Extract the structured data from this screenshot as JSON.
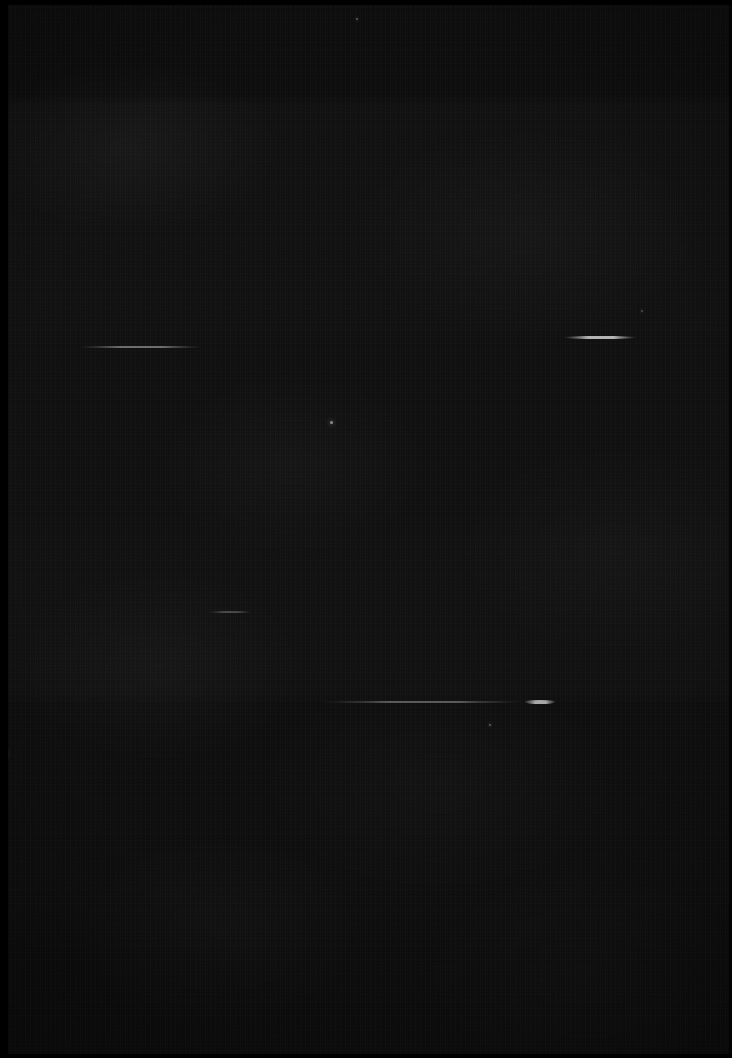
{
  "image": {
    "title": "Dark exposure frame",
    "width": 732,
    "height": 1058,
    "overall_description": "Near-black, heavily underexposed photographic frame dominated by sensor noise, with faint horizontal light streaks and a few small bright point sources.",
    "background_color": "#0d0d0d",
    "darkest_color": "#000000",
    "brightest_color": "#b4b4b4"
  },
  "borders": {
    "left_strip": {
      "label": "left black border",
      "x": 0,
      "y": 0,
      "width": 8,
      "height": 1058,
      "color": "#000000"
    },
    "top_strip": {
      "label": "top black border",
      "x": 0,
      "y": 0,
      "width": 732,
      "height": 5,
      "color": "#000000"
    },
    "bottom_strip": {
      "label": "bottom black border",
      "x": 0,
      "y": 1054,
      "width": 732,
      "height": 4,
      "color": "#000000"
    },
    "right_strip": {
      "label": "right dark edge",
      "x": 729,
      "y": 0,
      "width": 3,
      "height": 1058,
      "color": "#050505"
    }
  },
  "bands": [
    {
      "label": "upper band edge",
      "y": 103,
      "description": "subtle black-level step"
    },
    {
      "label": "mid band edge",
      "y": 340,
      "description": "subtle black-level step"
    },
    {
      "label": "lower band edge",
      "y": 700,
      "description": "subtle black-level step"
    },
    {
      "label": "bottom falloff",
      "y": 960,
      "description": "gradual darkening toward bottom"
    }
  ],
  "streaks": [
    {
      "name": "streak-left-upper",
      "x": 78,
      "y": 346,
      "length": 124,
      "thickness": 2,
      "peak_color": "#6e6e6e",
      "description": "thin faint horizontal trail, left of centre"
    },
    {
      "name": "streak-right-upper",
      "x": 563,
      "y": 336,
      "length": 74,
      "thickness": 3,
      "peak_color": "#b4b4b4",
      "description": "brightest trail, tapered at both ends, upper right"
    },
    {
      "name": "streak-left-lower",
      "x": 208,
      "y": 611,
      "length": 44,
      "thickness": 2,
      "peak_color": "#4a4a4a",
      "description": "very short faint trail, mid left"
    },
    {
      "name": "streak-long-lower",
      "x": 318,
      "y": 701,
      "length": 208,
      "thickness": 2,
      "peak_color": "#5a5a5a",
      "description": "long thin faint trail crossing lower centre"
    },
    {
      "name": "streak-bright-lower",
      "x": 524,
      "y": 700,
      "length": 32,
      "thickness": 4,
      "peak_color": "#a8a8a8",
      "description": "short bright thick segment at right end of the long lower trail"
    }
  ],
  "points": [
    {
      "name": "point-centre",
      "x": 330,
      "y": 421,
      "size": 3,
      "color": "#8c8c8c",
      "description": "small bright dot near centre"
    },
    {
      "name": "point-left-edge",
      "x": 2,
      "y": 752,
      "size": 4,
      "color": "#7a7a7a",
      "description": "bright dot on the far left edge"
    },
    {
      "name": "point-lower-centre",
      "x": 489,
      "y": 724,
      "size": 2,
      "color": "#5e5e5e",
      "description": "faint dot below the long lower trail"
    },
    {
      "name": "point-upper-centre",
      "x": 356,
      "y": 18,
      "size": 2,
      "color": "#585858",
      "description": "faint dot near the top edge"
    },
    {
      "name": "point-upper-right",
      "x": 641,
      "y": 310,
      "size": 2,
      "color": "#4e4e4e",
      "description": "very faint dot upper right"
    }
  ]
}
